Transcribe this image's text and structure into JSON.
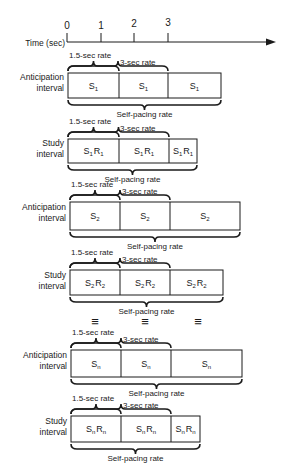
{
  "axis": {
    "label": "Time (sec)",
    "ticks": [
      "0",
      "1",
      "2",
      "3"
    ]
  },
  "labels": {
    "rate_15": "1.5-sec rate",
    "rate_3": "3-sec rate",
    "self_pacing": "Self-pacing rate",
    "ellipsis": "≡"
  },
  "rows": [
    {
      "label1": "Anticipation",
      "label2": "interval",
      "cells": [
        "S1",
        "S1",
        "S1"
      ],
      "sub": "1",
      "kind": "anticipation"
    },
    {
      "label1": "Study",
      "label2": "interval",
      "cells": [
        "S1R1",
        "S1R1",
        "S1R1"
      ],
      "sub": "1",
      "kind": "study"
    },
    {
      "label1": "Anticipation",
      "label2": "interval",
      "cells": [
        "S2",
        "S2",
        "S2"
      ],
      "sub": "2",
      "kind": "anticipation"
    },
    {
      "label1": "Study",
      "label2": "interval",
      "cells": [
        "S2R2",
        "S2R2",
        "S2R2"
      ],
      "sub": "2",
      "kind": "study"
    },
    {
      "label1": "Anticipation",
      "label2": "interval",
      "cells": [
        "Sn",
        "Sn",
        "Sn"
      ],
      "sub": "n",
      "kind": "anticipation"
    },
    {
      "label1": "Study",
      "label2": "interval",
      "cells": [
        "SnRn",
        "SnRn",
        "SnRn"
      ],
      "sub": "n",
      "kind": "study"
    }
  ]
}
